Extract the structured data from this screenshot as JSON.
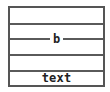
{
  "diagram": {
    "rows": [
      {
        "label": ""
      },
      {
        "label": "b"
      },
      {
        "label": ""
      },
      {
        "label": ""
      },
      {
        "label": "text"
      }
    ],
    "line_label": "b",
    "footer_text": "text",
    "colors": {
      "border": "#555555",
      "text": "#222222",
      "background": "#ffffff"
    }
  }
}
